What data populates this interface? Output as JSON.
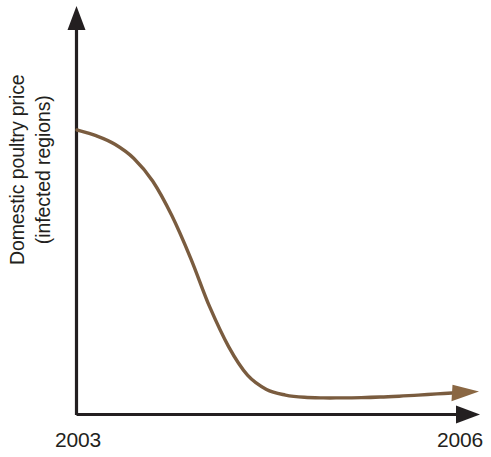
{
  "figure": {
    "background_color": "#ffffff",
    "axis_color": "#231f20",
    "curve_color": "#7a5c3f",
    "arrow_color": "#8a6743"
  },
  "axes": {
    "y_label_line1": "Domestic poultry price",
    "y_label_line2": "(infected regions)",
    "x_tick_start": "2003",
    "x_tick_end": "2006",
    "y_axis_name": "y-axis-arrow",
    "x_axis_name": "x-axis-arrow"
  },
  "chart_data": {
    "type": "line",
    "title": "",
    "subtitle": "",
    "xlabel": "",
    "ylabel": "Domestic poultry price (infected regions)",
    "x": [
      2003.0,
      2003.15,
      2003.3,
      2003.45,
      2003.6,
      2003.75,
      2003.9,
      2004.05,
      2004.2,
      2004.35,
      2004.5,
      2004.65,
      2004.8,
      2004.95,
      2005.1,
      2005.25,
      2005.4,
      2005.55,
      2005.7,
      2005.85,
      2006.0
    ],
    "values": [
      100,
      98,
      95,
      90,
      82,
      70,
      55,
      38,
      24,
      14,
      9,
      7,
      6.2,
      6.0,
      6.0,
      6.1,
      6.3,
      6.6,
      7.0,
      7.4,
      7.8
    ],
    "series": [
      {
        "name": "Domestic poultry price (infected regions)",
        "color": "#7a5c3f",
        "values": [
          100,
          98,
          95,
          90,
          82,
          70,
          55,
          38,
          24,
          14,
          9,
          7,
          6.2,
          6.0,
          6.0,
          6.1,
          6.3,
          6.6,
          7.0,
          7.4,
          7.8
        ]
      }
    ],
    "xlim": [
      2003,
      2006
    ],
    "ylim": [
      0,
      115
    ],
    "xticks": [
      2003,
      2006
    ],
    "xticklabels": [
      "2003",
      "2006"
    ],
    "yticks": [],
    "yticklabels": [],
    "grid": false,
    "legend": null,
    "annotations": []
  }
}
